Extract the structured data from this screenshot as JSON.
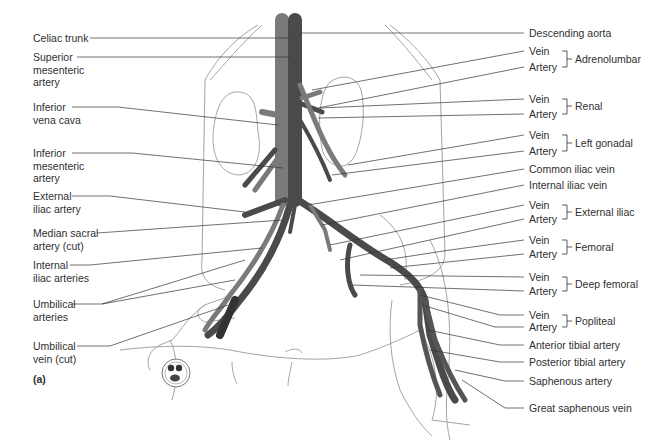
{
  "figure_label": "(a)",
  "left_labels": [
    {
      "id": "celiac",
      "lines": [
        "Celiac trunk"
      ]
    },
    {
      "id": "sup-mes",
      "lines": [
        "Superior",
        "mesenteric",
        "artery"
      ]
    },
    {
      "id": "ivc",
      "lines": [
        "Inferior",
        "vena cava"
      ]
    },
    {
      "id": "inf-mes",
      "lines": [
        "Inferior",
        "mesenteric",
        "artery"
      ]
    },
    {
      "id": "ext-iliac-art",
      "lines": [
        "External",
        "iliac artery"
      ]
    },
    {
      "id": "median-sacral",
      "lines": [
        "Median sacral",
        "artery (cut)"
      ]
    },
    {
      "id": "int-iliac-art",
      "lines": [
        "Internal",
        "iliac arteries"
      ]
    },
    {
      "id": "umb-art",
      "lines": [
        "Umbilical",
        "arteries"
      ]
    },
    {
      "id": "umb-vein",
      "lines": [
        "Umbilical",
        "vein (cut)"
      ]
    }
  ],
  "right_labels": {
    "descending_aorta": "Descending aorta",
    "common_iliac_vein": "Common iliac vein",
    "internal_iliac_vein": "Internal iliac vein",
    "anterior_tibial_artery": "Anterior tibial artery",
    "posterior_tibial_artery": "Posterior tibial artery",
    "saphenous_artery": "Saphenous artery",
    "great_saphenous_vein": "Great saphenous vein"
  },
  "paired_groups": [
    {
      "name": "Adrenolumbar",
      "vein": "Vein",
      "artery": "Artery"
    },
    {
      "name": "Renal",
      "vein": "Vein",
      "artery": "Artery"
    },
    {
      "name": "Left gonadal",
      "vein": "Vein",
      "artery": "Artery"
    },
    {
      "name": "External iliac",
      "vein": "Vein",
      "artery": "Artery"
    },
    {
      "name": "Femoral",
      "vein": "Vein",
      "artery": "Artery"
    },
    {
      "name": "Deep femoral",
      "vein": "Vein",
      "artery": "Artery"
    },
    {
      "name": "Popliteal",
      "vein": "Vein",
      "artery": "Artery"
    }
  ],
  "colors": {
    "artery": "#4a4a4a",
    "vein": "#7a7a7a",
    "outline": "#8a8a8a",
    "leader": "#333333"
  }
}
